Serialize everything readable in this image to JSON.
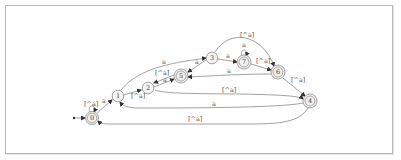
{
  "diagram": {
    "type": "finite-automaton",
    "start_state": "0",
    "nodes": [
      {
        "id": "0",
        "label": "0",
        "accepting": true
      },
      {
        "id": "1",
        "label": "1",
        "accepting": false
      },
      {
        "id": "2",
        "label": "2",
        "accepting": false
      },
      {
        "id": "3",
        "label": "3",
        "accepting": false
      },
      {
        "id": "4",
        "label": "4",
        "accepting": true
      },
      {
        "id": "5",
        "label": "5",
        "accepting": true
      },
      {
        "id": "6",
        "label": "6",
        "accepting": true
      },
      {
        "id": "7",
        "label": "7",
        "accepting": true
      }
    ],
    "edges": [
      {
        "from": "0",
        "to": "0",
        "label": "[^a]"
      },
      {
        "from": "0",
        "to": "1",
        "label": "a"
      },
      {
        "from": "1",
        "to": "2",
        "label": "[^a]"
      },
      {
        "from": "1",
        "to": "3",
        "label": "a"
      },
      {
        "from": "2",
        "to": "5",
        "label": "a"
      },
      {
        "from": "5",
        "to": "2",
        "label": "[^a]"
      },
      {
        "from": "3",
        "to": "5",
        "label": "a"
      },
      {
        "from": "3",
        "to": "7",
        "label": "a"
      },
      {
        "from": "3",
        "to": "6",
        "label": "[^a]"
      },
      {
        "from": "7",
        "to": "7",
        "label": "a"
      },
      {
        "from": "7",
        "to": "6",
        "label": "[^a]"
      },
      {
        "from": "6",
        "to": "5",
        "label": "a"
      },
      {
        "from": "6",
        "to": "4",
        "label": "[^a]"
      },
      {
        "from": "2",
        "to": "4",
        "label": "[^a]"
      },
      {
        "from": "4",
        "to": "1",
        "label": "a"
      },
      {
        "from": "4",
        "to": "0",
        "label": "[^a]"
      }
    ]
  }
}
